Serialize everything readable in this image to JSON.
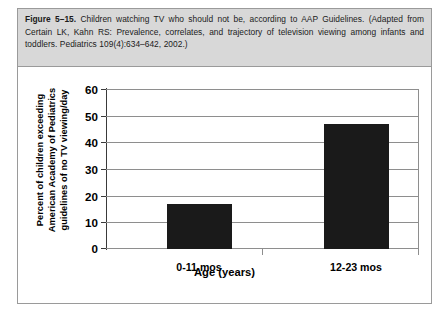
{
  "caption": {
    "figure_number": "Figure 5–15.",
    "text": " Children watching TV who should not be, according to AAP Guidelines. (Adapted from Certain LK, Kahn RS: Prevalence, correlates, and trajectory of television viewing among infants and toddlers. Pediatrics 109(4):634–642, 2002.)"
  },
  "chart_data": {
    "type": "bar",
    "title": "",
    "categories": [
      "0-11 mos",
      "12-23 mos"
    ],
    "values": [
      17,
      47
    ],
    "series": [
      {
        "name": "Percent of children exceeding AAP guidelines of no TV viewing/day",
        "values": [
          17,
          47
        ]
      }
    ],
    "xlabel": "Age (years)",
    "ylabel_lines": [
      "Percent of children exceeding",
      "American Academy of Pediatrics",
      "guidelines of no TV viewing/day"
    ],
    "ylabel": "Percent of children exceeding American Academy of Pediatrics guidelines of no TV viewing/day",
    "ylim": [
      0,
      60
    ],
    "yticks": [
      0,
      10,
      20,
      30,
      40,
      50,
      60
    ],
    "ytick_labels": [
      "0",
      "10",
      "20",
      "30",
      "40",
      "50",
      "60"
    ],
    "grid": true,
    "legend": false,
    "bar_color": "#1a1a1a"
  },
  "colors": {
    "caption_background": "#d8d8d8",
    "frame_border": "#9a9a9a",
    "grid": "#8e8e8e",
    "bar": "#1a1a1a",
    "text": "#000000"
  }
}
